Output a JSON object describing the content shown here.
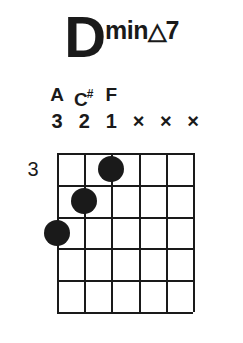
{
  "chord": {
    "root": "D",
    "quality_text": "min",
    "quality_symbol": "△",
    "quality_extension": "7",
    "full_name": "Dmin△7"
  },
  "fretboard": {
    "position_marker": "3",
    "num_strings": 6,
    "num_frets": 5,
    "accent_color": "#1a1a1a",
    "background_color": "#ffffff"
  },
  "strings": [
    {
      "index": 1,
      "note": "A",
      "accidental": "",
      "finger": "3",
      "muted": false
    },
    {
      "index": 2,
      "note": "C",
      "accidental": "#",
      "finger": "2",
      "muted": false
    },
    {
      "index": 3,
      "note": "F",
      "accidental": "",
      "finger": "1",
      "muted": false
    },
    {
      "index": 4,
      "note": "",
      "accidental": "",
      "finger": "×",
      "muted": true
    },
    {
      "index": 5,
      "note": "",
      "accidental": "",
      "finger": "×",
      "muted": true
    },
    {
      "index": 6,
      "note": "",
      "accidental": "",
      "finger": "×",
      "muted": true
    }
  ],
  "dots": [
    {
      "string": 3,
      "fret": 1,
      "finger": "1"
    },
    {
      "string": 2,
      "fret": 2,
      "finger": "2"
    },
    {
      "string": 1,
      "fret": 3,
      "finger": "3"
    }
  ]
}
